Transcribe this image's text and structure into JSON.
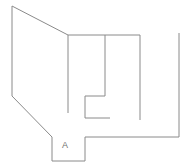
{
  "drawing": {
    "title": "Floor plan sketch",
    "background_color": "#ffffff",
    "line_color": "#8a8a8a",
    "line_width": 1,
    "canvas": {
      "width": 190,
      "height": 167
    }
  },
  "labels": {
    "room_a": {
      "text": "A",
      "x": 65,
      "y": 148,
      "color": "#6f6f6f",
      "font_size": 9
    }
  },
  "geometry": {
    "outer_wall": {
      "name": "building-outline",
      "points": "12,6 12,96 52,137 52,161 85,161 85,137 179,137 179,33"
    },
    "top_wall": {
      "name": "top-interior-wall",
      "points": "68,35 140,35"
    },
    "diagonal_wall": {
      "name": "diagonal-facade-wall",
      "points": "12,6 68,35"
    },
    "partitions": [
      {
        "name": "partition-left",
        "points": "68,35 68,113"
      },
      {
        "name": "partition-middle",
        "points": "105,35 105,96"
      },
      {
        "name": "partition-right",
        "points": "140,35 140,120"
      }
    ],
    "inner_notch": {
      "name": "inner-step-wall",
      "points": "105,96 85,96 85,118 110,118"
    }
  }
}
